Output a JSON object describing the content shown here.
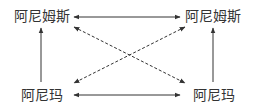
{
  "diagram": {
    "nodes": {
      "top_left": {
        "label": "阿尼姆斯"
      },
      "top_right": {
        "label": "阿尼姆斯"
      },
      "bottom_left": {
        "label": "阿尼玛"
      },
      "bottom_right": {
        "label": "阿尼玛"
      }
    },
    "edges": [
      {
        "from": "top_left",
        "to": "top_right",
        "style": "solid",
        "direction": "both"
      },
      {
        "from": "bottom_left",
        "to": "bottom_right",
        "style": "solid",
        "direction": "both"
      },
      {
        "from": "bottom_left",
        "to": "top_left",
        "style": "solid",
        "direction": "forward"
      },
      {
        "from": "bottom_right",
        "to": "top_right",
        "style": "solid",
        "direction": "forward"
      },
      {
        "from": "top_left",
        "to": "bottom_right",
        "style": "dashed",
        "direction": "both"
      },
      {
        "from": "top_right",
        "to": "bottom_left",
        "style": "dashed",
        "direction": "both"
      }
    ],
    "colors": {
      "line": "#333333",
      "text": "#333333"
    }
  }
}
